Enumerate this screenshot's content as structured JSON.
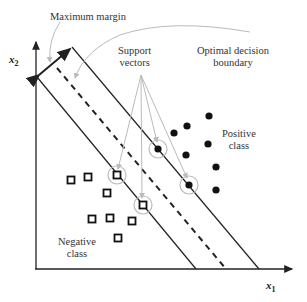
{
  "labels": {
    "maximum_margin": "Maximum margin",
    "support_vectors_line1": "Support",
    "support_vectors_line2": "vectors",
    "optimal_line1": "Optimal decision",
    "optimal_line2": "boundary",
    "positive_line1": "Positive",
    "positive_line2": "class",
    "negative_line1": "Negative",
    "negative_line2": "class",
    "x_axis": "x",
    "x_axis_sub": "1",
    "y_axis": "x",
    "y_axis_sub": "2"
  },
  "colors": {
    "line": "#222222",
    "annotation": "#bbbbbb",
    "point": "#111111"
  },
  "positive_points": [
    [
      209,
      116
    ],
    [
      187,
      126
    ],
    [
      174,
      133
    ],
    [
      208,
      144
    ],
    [
      186,
      155
    ],
    [
      216,
      167
    ],
    [
      216,
      190
    ]
  ],
  "positive_support_vectors": [
    [
      158,
      149
    ],
    [
      189,
      185
    ]
  ],
  "negative_points": [
    [
      71,
      180
    ],
    [
      88,
      177
    ],
    [
      107,
      193
    ],
    [
      92,
      219
    ],
    [
      110,
      218
    ],
    [
      132,
      221
    ],
    [
      118,
      238
    ]
  ],
  "negative_support_vectors": [
    [
      117,
      175
    ],
    [
      143,
      205
    ]
  ]
}
